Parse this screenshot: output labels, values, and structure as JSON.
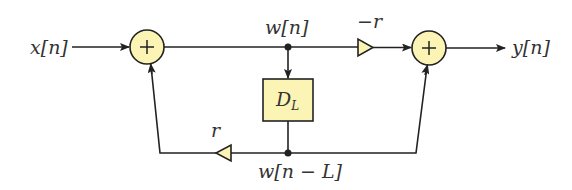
{
  "diagram": {
    "type": "signal-flow block diagram (comb filter / allpass)",
    "colors": {
      "block_fill": "#fbf4b4",
      "stroke": "#222222",
      "text": "#333333"
    },
    "signals": {
      "input": "x[n]",
      "output": "y[n]",
      "internal": "w[n]",
      "delayed": "w[n − L]"
    },
    "blocks": {
      "delay": {
        "label_main": "D",
        "label_sub": "L"
      },
      "adder_in": {
        "symbol": "+"
      },
      "adder_out": {
        "symbol": "+"
      },
      "gain_forward": {
        "label": "−r"
      },
      "gain_feedback": {
        "label": "r"
      }
    }
  }
}
